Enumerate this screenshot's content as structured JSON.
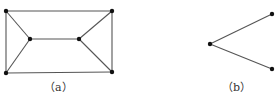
{
  "figures": [
    {
      "id": "a",
      "caption": "（a）",
      "caption_pos": [
        44,
        82
      ],
      "vertices": [
        {
          "name": "top-left",
          "x": 6,
          "y": 11
        },
        {
          "name": "top-right",
          "x": 112,
          "y": 11
        },
        {
          "name": "bottom-left",
          "x": 6,
          "y": 73
        },
        {
          "name": "bottom-right",
          "x": 112,
          "y": 72
        },
        {
          "name": "inner-left",
          "x": 30,
          "y": 39
        },
        {
          "name": "inner-right",
          "x": 79,
          "y": 39
        }
      ],
      "edges": [
        [
          0,
          1
        ],
        [
          2,
          3
        ],
        [
          0,
          2
        ],
        [
          1,
          3
        ],
        [
          0,
          4
        ],
        [
          2,
          4
        ],
        [
          4,
          5
        ],
        [
          1,
          5
        ],
        [
          3,
          5
        ]
      ]
    },
    {
      "id": "b",
      "caption": "（b）",
      "caption_pos": [
        222,
        82
      ],
      "vertices": [
        {
          "name": "left",
          "x": 210,
          "y": 44
        },
        {
          "name": "upper-right",
          "x": 272,
          "y": 14
        },
        {
          "name": "lower-right",
          "x": 272,
          "y": 69
        }
      ],
      "edges": [
        [
          0,
          1
        ],
        [
          0,
          2
        ]
      ]
    }
  ],
  "style": {
    "edge_color": "#555555",
    "vertex_color": "#111111",
    "vertex_radius": 2.2
  }
}
